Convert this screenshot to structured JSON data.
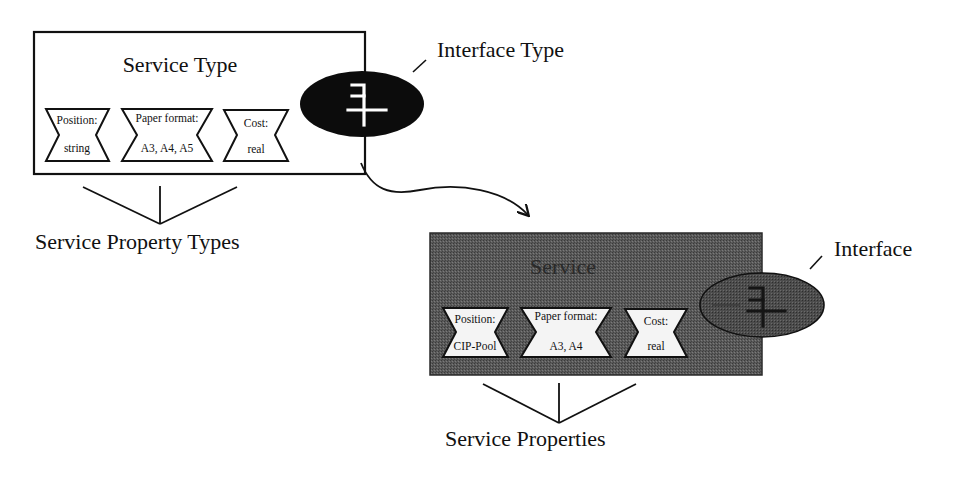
{
  "diagram": {
    "service_type": {
      "title": "Service Type",
      "properties": [
        {
          "name": "Position:",
          "value": "string"
        },
        {
          "name": "Paper format:",
          "value": "A3, A4, A5"
        },
        {
          "name": "Cost:",
          "value": "real"
        }
      ],
      "interface_label": "Interface Type",
      "properties_label": "Service Property Types"
    },
    "service": {
      "title": "Service",
      "properties": [
        {
          "name": "Position:",
          "value": "CIP-Pool"
        },
        {
          "name": "Paper format:",
          "value": "A3, A4"
        },
        {
          "name": "Cost:",
          "value": "real"
        }
      ],
      "interface_label": "Interface",
      "properties_label": "Service Properties"
    },
    "colors": {
      "ink": "#111111",
      "service_fill": "#555555",
      "interface_type_fill": "#0c0c0c",
      "interface_fill": "#4a4a4a",
      "background": "#ffffff"
    }
  }
}
